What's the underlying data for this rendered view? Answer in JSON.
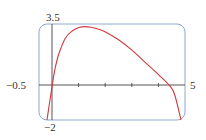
{
  "chart_data": {
    "type": "line",
    "title": "",
    "xlabel": "",
    "ylabel": "",
    "xlim": [
      -0.5,
      5
    ],
    "ylim": [
      -2,
      3.5
    ],
    "x_tick_labels": [
      "-0.5",
      "5"
    ],
    "y_tick_labels": [
      "3.5",
      "-2"
    ],
    "x_ticks_unlabeled": [
      1,
      2,
      3,
      4
    ],
    "grid": false,
    "series": [
      {
        "name": "f(x)",
        "color": "#d0393b",
        "x": [
          -0.2,
          -0.1,
          0,
          0.1,
          0.25,
          0.5,
          0.75,
          1.0,
          1.25,
          1.5,
          1.75,
          2.0,
          2.5,
          3.0,
          3.5,
          4.0,
          4.4,
          4.6,
          4.85
        ],
        "y": [
          -2.0,
          -1.0,
          0.0,
          0.9,
          1.8,
          2.7,
          3.1,
          3.3,
          3.35,
          3.3,
          3.2,
          3.05,
          2.6,
          2.0,
          1.3,
          0.6,
          0.0,
          -0.5,
          -2.0
        ]
      }
    ]
  },
  "labels": {
    "ymax": "3.5",
    "ymin": "−2",
    "xmin": "−0.5",
    "xmax": "5"
  },
  "colors": {
    "frame": "#8fa8d0",
    "axis": "#555555",
    "curve": "#d0393b"
  }
}
